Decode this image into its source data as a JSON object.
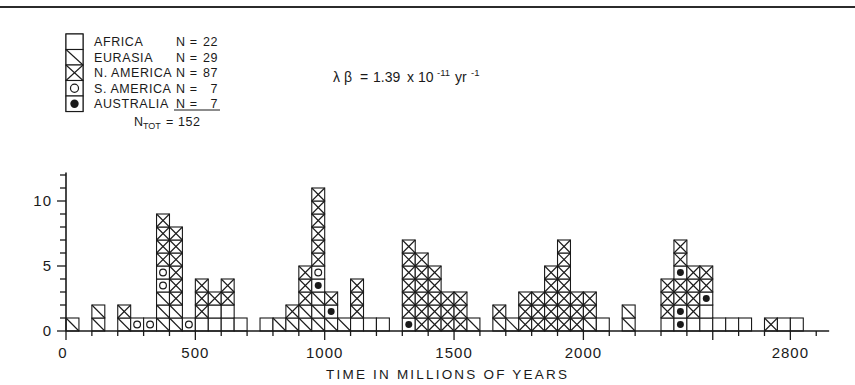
{
  "chart_data": {
    "type": "bar",
    "title": "",
    "xlabel": "TIME IN MILLIONS OF YEARS",
    "ylabel": "",
    "xlim": [
      0,
      2950
    ],
    "ylim": [
      0,
      12
    ],
    "bin_width": 50,
    "x_ticks_major": [
      0,
      500,
      1000,
      1500,
      2000,
      2500
    ],
    "x_ticks_labeled": [
      {
        "value": 0,
        "label": "0"
      },
      {
        "value": 500,
        "label": "500"
      },
      {
        "value": 1000,
        "label": "1000"
      },
      {
        "value": 1500,
        "label": "1500"
      },
      {
        "value": 2000,
        "label": "2000"
      },
      {
        "value": 2800,
        "label": "2800"
      }
    ],
    "x_tick_minor_step": 100,
    "y_ticks_labeled": [
      {
        "value": 0,
        "label": "0"
      },
      {
        "value": 5,
        "label": "5"
      },
      {
        "value": 10,
        "label": "10"
      }
    ],
    "y_tick_minor_step": 1,
    "grid": false,
    "legend_position": "top-left",
    "categories": [
      "AFRICA",
      "EURASIA",
      "N. AMERICA",
      "S. AMERICA",
      "AUSTRALIA"
    ],
    "series": [
      {
        "name": "AFRICA",
        "pattern": "blank",
        "count": 22
      },
      {
        "name": "EURASIA",
        "pattern": "diagonal",
        "count": 29
      },
      {
        "name": "N. AMERICA",
        "pattern": "cross",
        "count": 87
      },
      {
        "name": "S. AMERICA",
        "pattern": "open-circle",
        "count": 7
      },
      {
        "name": "AUSTRALIA",
        "pattern": "filled-circle",
        "count": 7
      }
    ],
    "total": 152,
    "annotation": "lambda-beta = 1.39 x 10^-11 yr^-1",
    "bins": [
      {
        "x": 50,
        "height": 1,
        "cells": [
          "diagonal"
        ]
      },
      {
        "x": 150,
        "height": 2,
        "cells": [
          "diagonal",
          "diagonal"
        ]
      },
      {
        "x": 250,
        "height": 2,
        "cells": [
          "diagonal",
          "cross"
        ]
      },
      {
        "x": 300,
        "height": 1,
        "cells": [
          "open-circle"
        ]
      },
      {
        "x": 350,
        "height": 1,
        "cells": [
          "open-circle"
        ]
      },
      {
        "x": 400,
        "height": 9,
        "cells": [
          "diagonal",
          "diagonal",
          "diagonal",
          "open-circle",
          "open-circle",
          "cross",
          "cross",
          "cross",
          "cross"
        ]
      },
      {
        "x": 450,
        "height": 8,
        "cells": [
          "diagonal",
          "diagonal",
          "cross",
          "cross",
          "cross",
          "cross",
          "cross",
          "cross"
        ]
      },
      {
        "x": 500,
        "height": 1,
        "cells": [
          "open-circle"
        ]
      },
      {
        "x": 550,
        "height": 4,
        "cells": [
          "blank",
          "cross",
          "cross",
          "cross"
        ]
      },
      {
        "x": 600,
        "height": 3,
        "cells": [
          "blank",
          "blank",
          "cross"
        ]
      },
      {
        "x": 650,
        "height": 4,
        "cells": [
          "blank",
          "blank",
          "cross",
          "cross"
        ]
      },
      {
        "x": 700,
        "height": 1,
        "cells": [
          "blank"
        ]
      },
      {
        "x": 800,
        "height": 1,
        "cells": [
          "blank"
        ]
      },
      {
        "x": 850,
        "height": 1,
        "cells": [
          "diagonal"
        ]
      },
      {
        "x": 900,
        "height": 2,
        "cells": [
          "diagonal",
          "cross"
        ]
      },
      {
        "x": 950,
        "height": 5,
        "cells": [
          "diagonal",
          "diagonal",
          "cross",
          "cross",
          "cross"
        ]
      },
      {
        "x": 1000,
        "height": 11,
        "cells": [
          "diagonal",
          "diagonal",
          "diagonal",
          "filled-circle",
          "open-circle",
          "cross",
          "cross",
          "cross",
          "cross",
          "cross",
          "cross"
        ]
      },
      {
        "x": 1050,
        "height": 3,
        "cells": [
          "diagonal",
          "filled-circle",
          "cross"
        ]
      },
      {
        "x": 1100,
        "height": 1,
        "cells": [
          "diagonal"
        ]
      },
      {
        "x": 1150,
        "height": 4,
        "cells": [
          "blank",
          "cross",
          "cross",
          "cross"
        ]
      },
      {
        "x": 1200,
        "height": 1,
        "cells": [
          "blank"
        ]
      },
      {
        "x": 1250,
        "height": 1,
        "cells": [
          "blank"
        ]
      },
      {
        "x": 1350,
        "height": 7,
        "cells": [
          "filled-circle",
          "cross",
          "cross",
          "cross",
          "cross",
          "cross",
          "cross"
        ]
      },
      {
        "x": 1400,
        "height": 6,
        "cells": [
          "cross",
          "cross",
          "cross",
          "cross",
          "cross",
          "cross"
        ]
      },
      {
        "x": 1450,
        "height": 5,
        "cells": [
          "cross",
          "cross",
          "cross",
          "cross",
          "cross"
        ]
      },
      {
        "x": 1500,
        "height": 3,
        "cells": [
          "cross",
          "cross",
          "cross"
        ]
      },
      {
        "x": 1550,
        "height": 3,
        "cells": [
          "cross",
          "cross",
          "cross"
        ]
      },
      {
        "x": 1600,
        "height": 1,
        "cells": [
          "diagonal"
        ]
      },
      {
        "x": 1700,
        "height": 2,
        "cells": [
          "diagonal",
          "cross"
        ]
      },
      {
        "x": 1750,
        "height": 1,
        "cells": [
          "diagonal"
        ]
      },
      {
        "x": 1800,
        "height": 3,
        "cells": [
          "cross",
          "cross",
          "cross"
        ]
      },
      {
        "x": 1850,
        "height": 3,
        "cells": [
          "cross",
          "cross",
          "cross"
        ]
      },
      {
        "x": 1900,
        "height": 5,
        "cells": [
          "cross",
          "cross",
          "cross",
          "cross",
          "cross"
        ]
      },
      {
        "x": 1950,
        "height": 7,
        "cells": [
          "cross",
          "cross",
          "cross",
          "cross",
          "cross",
          "cross",
          "cross"
        ]
      },
      {
        "x": 2000,
        "height": 3,
        "cells": [
          "cross",
          "cross",
          "cross"
        ]
      },
      {
        "x": 2050,
        "height": 3,
        "cells": [
          "diagonal",
          "cross",
          "cross"
        ]
      },
      {
        "x": 2100,
        "height": 1,
        "cells": [
          "blank"
        ]
      },
      {
        "x": 2200,
        "height": 2,
        "cells": [
          "diagonal",
          "diagonal"
        ]
      },
      {
        "x": 2350,
        "height": 4,
        "cells": [
          "blank",
          "cross",
          "cross",
          "cross"
        ]
      },
      {
        "x": 2400,
        "height": 7,
        "cells": [
          "filled-circle",
          "filled-circle",
          "cross",
          "cross",
          "filled-circle",
          "cross",
          "cross"
        ]
      },
      {
        "x": 2450,
        "height": 5,
        "cells": [
          "blank",
          "cross",
          "cross",
          "cross",
          "cross"
        ]
      },
      {
        "x": 2500,
        "height": 5,
        "cells": [
          "blank",
          "blank",
          "filled-circle",
          "cross",
          "cross"
        ]
      },
      {
        "x": 2550,
        "height": 1,
        "cells": [
          "blank"
        ]
      },
      {
        "x": 2600,
        "height": 1,
        "cells": [
          "blank"
        ]
      },
      {
        "x": 2650,
        "height": 1,
        "cells": [
          "blank"
        ]
      },
      {
        "x": 2750,
        "height": 1,
        "cells": [
          "cross"
        ]
      },
      {
        "x": 2800,
        "height": 1,
        "cells": [
          "blank"
        ]
      },
      {
        "x": 2850,
        "height": 1,
        "cells": [
          "blank"
        ]
      }
    ]
  },
  "legend": {
    "rows": [
      {
        "label": "AFRICA",
        "n_prefix": "N =",
        "n_value": "22",
        "pattern": "blank"
      },
      {
        "label": "EURASIA",
        "n_prefix": "N =",
        "n_value": "29",
        "pattern": "diagonal"
      },
      {
        "label": "N. AMERICA",
        "n_prefix": "N =",
        "n_value": "87",
        "pattern": "cross"
      },
      {
        "label": "S. AMERICA",
        "n_prefix": "N =",
        "n_value": "7",
        "pattern": "open-circle"
      },
      {
        "label": "AUSTRALIA",
        "n_prefix": "N =",
        "n_value": "7",
        "pattern": "filled-circle"
      }
    ],
    "total_label": "N",
    "total_sub": "TOT",
    "total_eq": "=",
    "total_value": "152"
  },
  "annotation": {
    "lambda": "λ",
    "beta": "β",
    "equals": "=",
    "mantissa": "1.39",
    "times": "x",
    "base": "10",
    "exponent": "-11",
    "unit": "yr",
    "unit_exponent": "-1"
  },
  "axes": {
    "x_title": "TIME IN MILLIONS OF YEARS",
    "x_labels": [
      "0",
      "500",
      "1000",
      "1500",
      "2000",
      "2800"
    ],
    "y_labels": [
      "0",
      "5",
      "10"
    ],
    "origin_label": "0"
  },
  "colors": {
    "ink": "#1a1a1a",
    "line": "#2b2b2b",
    "background": "#ffffff"
  }
}
